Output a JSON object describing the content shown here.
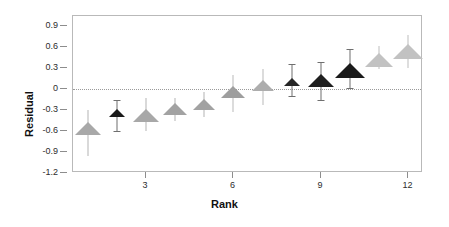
{
  "chart_data": {
    "type": "scatter",
    "title": "",
    "xlabel": "Rank",
    "ylabel": "Residual",
    "grid": false,
    "legend": "none",
    "xlim": [
      0.5,
      12.5
    ],
    "ylim": [
      -1.2,
      1.05
    ],
    "x": [
      1,
      2,
      3,
      4,
      5,
      6,
      7,
      8,
      9,
      10,
      11,
      12
    ],
    "values": [
      -0.57,
      -0.35,
      -0.38,
      -0.29,
      -0.22,
      -0.05,
      0.05,
      0.1,
      0.12,
      0.26,
      0.42,
      0.53
    ],
    "error_low": [
      -0.95,
      -0.6,
      -0.6,
      -0.46,
      -0.4,
      -0.32,
      -0.22,
      -0.1,
      -0.16,
      0.02,
      0.29,
      0.3
    ],
    "error_high": [
      -0.3,
      -0.16,
      -0.13,
      -0.12,
      -0.04,
      0.21,
      0.29,
      0.36,
      0.39,
      0.58,
      0.62,
      0.78
    ],
    "marker": "triangle-up",
    "marker_sizes": [
      13,
      8,
      13,
      12,
      11,
      12,
      11,
      8,
      13,
      15,
      14,
      15
    ],
    "marker_colors": [
      "#a8a8a8",
      "#1a1a1a",
      "#a8a8a8",
      "#a2a2a2",
      "#a2a2a2",
      "#9e9e9e",
      "#adadad",
      "#262626",
      "#1f1f1f",
      "#1a1a1a",
      "#c2c2c2",
      "#c2c2c2"
    ],
    "errorbar_colors": [
      "#d9d9d9",
      "#6f6f6f",
      "#d9d9d9",
      "#d9d9d9",
      "#d9d9d9",
      "#dcdcdc",
      "#dcdcdc",
      "#6f6f6f",
      "#6f6f6f",
      "#6f6f6f",
      "#dedede",
      "#dedede"
    ],
    "yticks": [
      0.9,
      0.6,
      0.3,
      0,
      -0.3,
      -0.6,
      -0.9,
      -1.2
    ],
    "ytick_labels": [
      "0.9",
      "0.6",
      "0.3",
      "0",
      "-0.3",
      "-0.6",
      "-0.9",
      "-1.2"
    ],
    "xticks": [
      3,
      6,
      9,
      12
    ],
    "xtick_labels": [
      "3",
      "6",
      "9",
      "12"
    ],
    "zero_line": 0,
    "zero_line_style": "dotted",
    "frame_color": "#b9b9b9",
    "background": "#ffffff"
  }
}
